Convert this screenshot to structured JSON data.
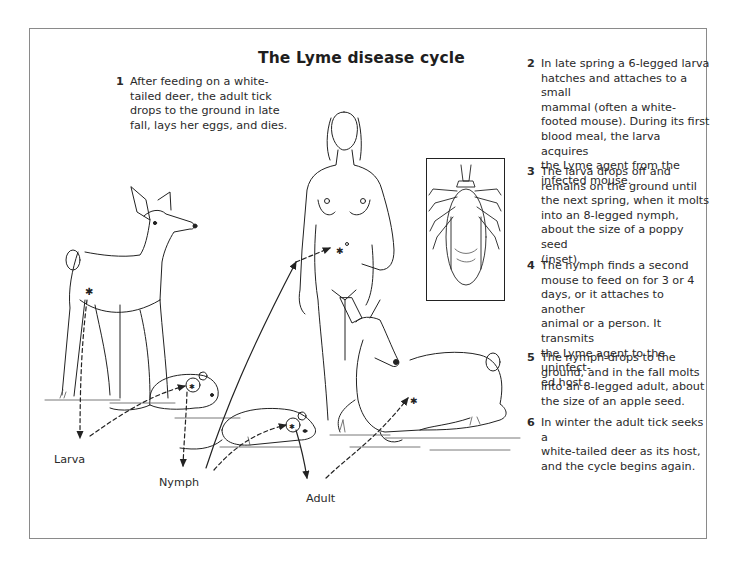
{
  "title": "The Lyme disease cycle",
  "steps": [
    {
      "number": "1",
      "lines": [
        "After feeding on a white-",
        "tailed deer, the adult tick",
        "drops to the ground in late",
        "fall, lays her eggs, and dies."
      ]
    },
    {
      "number": "2",
      "lines": [
        "In late spring a 6-legged larva",
        "hatches and attaches to a small",
        "mammal (often a white-",
        "footed mouse). During its first",
        "blood meal, the larva acquires",
        "the Lyme agent from the",
        "infected mouse."
      ]
    },
    {
      "number": "3",
      "lines": [
        "The larva drops off and",
        "remains on the ground until",
        "the next spring, when it molts",
        "into an 8-legged nymph,",
        "about the size of a poppy seed",
        "(inset)."
      ]
    },
    {
      "number": "4",
      "lines": [
        "The nymph finds a second",
        "mouse to feed on for 3 or 4",
        "days, or it attaches to another",
        "animal or a person. It transmits",
        "the Lyme agent to the uninfect-",
        "ed host."
      ]
    },
    {
      "number": "5",
      "lines": [
        "The nymph drops to the",
        "ground, and in the fall molts",
        "into an 8-legged adult, about",
        "the size of an apple seed."
      ]
    },
    {
      "number": "6",
      "lines": [
        "In winter the adult tick seeks a",
        "white-tailed deer as its host,",
        "and the cycle begins again."
      ]
    }
  ],
  "stage_labels": {
    "larva": "Larva",
    "nymph": "Nymph",
    "adult": "Adult"
  },
  "illustration": {
    "figures": [
      "standing-deer",
      "mouse-1",
      "mouse-2",
      "woman",
      "lying-deer",
      "tick-inset"
    ],
    "inset_subject": "engorged tick (nymph, magnified)",
    "colors": {
      "line": "#222222",
      "frame": "#8a8a8a",
      "background": "#ffffff"
    }
  }
}
